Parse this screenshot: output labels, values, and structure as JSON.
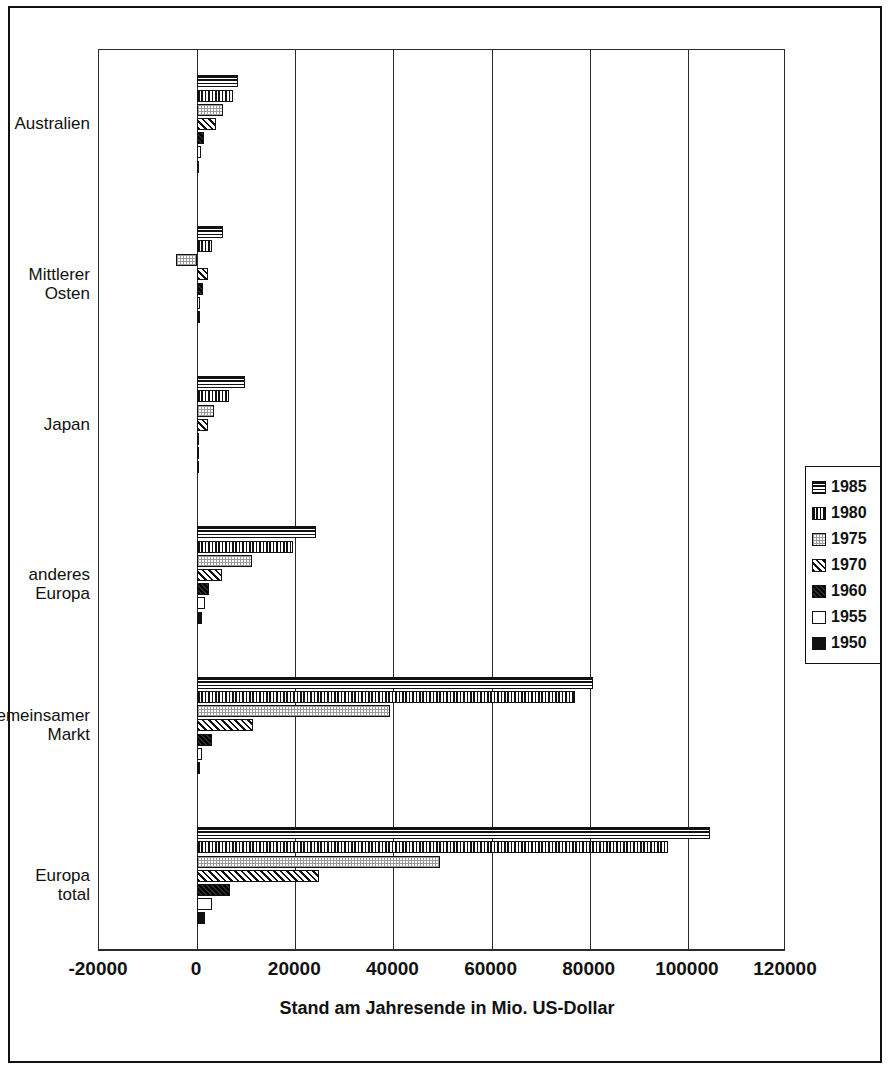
{
  "chart_data": {
    "type": "bar",
    "orientation": "horizontal",
    "title": "",
    "xlabel": "Stand am Jahresende in Mio. US-Dollar",
    "ylabel": "",
    "xlim": [
      -20000,
      120000
    ],
    "xticks": [
      "-20000",
      "0",
      "20000",
      "40000",
      "60000",
      "80000",
      "100000",
      "120000"
    ],
    "xtick_values": [
      -20000,
      0,
      20000,
      40000,
      60000,
      80000,
      100000,
      120000
    ],
    "grid": true,
    "legend_position": "right",
    "categories": [
      "Australien",
      "Mittlerer Osten",
      "Japan",
      "anderes Europa",
      "Gemeinsamer\nMarkt",
      "Europa total"
    ],
    "series": [
      {
        "name": "1985",
        "pattern": "horizontal-lines",
        "values": [
          8400,
          5300,
          9800,
          24300,
          80600,
          104500
        ]
      },
      {
        "name": "1980",
        "pattern": "vertical-lines",
        "values": [
          7400,
          3000,
          6500,
          19600,
          77000,
          96000
        ]
      },
      {
        "name": "1975",
        "pattern": "light-stipple",
        "values": [
          5300,
          -4300,
          3500,
          11200,
          39400,
          49500
        ]
      },
      {
        "name": "1970",
        "pattern": "diagonal-hatch",
        "values": [
          3900,
          2200,
          2200,
          5100,
          11400,
          24800
        ]
      },
      {
        "name": "1960",
        "pattern": "dark-dense",
        "values": [
          1300,
          1200,
          400,
          2400,
          3000,
          6700
        ]
      },
      {
        "name": "1955",
        "pattern": "white-empty",
        "values": [
          700,
          600,
          200,
          1600,
          1000,
          3000
        ]
      },
      {
        "name": "1950",
        "pattern": "solid-black",
        "values": [
          300,
          500,
          100,
          1000,
          500,
          1700
        ]
      }
    ]
  },
  "legend": {
    "items": [
      {
        "label": "1985",
        "pattern": "horizontal-lines"
      },
      {
        "label": "1980",
        "pattern": "vertical-lines"
      },
      {
        "label": "1975",
        "pattern": "light-stipple"
      },
      {
        "label": "1970",
        "pattern": "diagonal-hatch"
      },
      {
        "label": "1960",
        "pattern": "dark-dense"
      },
      {
        "label": "1955",
        "pattern": "white-empty"
      },
      {
        "label": "1950",
        "pattern": "solid-black"
      }
    ]
  },
  "colors": {
    "ink": "#111111",
    "axis": "#2b2b2b",
    "background": "#ffffff"
  },
  "caption": {
    "text": ""
  }
}
